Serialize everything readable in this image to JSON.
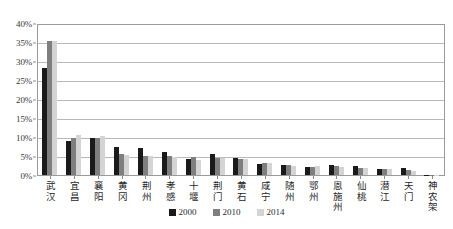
{
  "chart_data": {
    "type": "bar",
    "title": "",
    "subtitle": "",
    "xlabel": "",
    "ylabel": "",
    "ylim": [
      0,
      40
    ],
    "ytick_values": [
      0,
      5,
      10,
      15,
      20,
      25,
      30,
      35,
      40
    ],
    "ytick_labels": [
      "0%",
      "5%",
      "10%",
      "15%",
      "20%",
      "25%",
      "30%",
      "35%",
      "40%"
    ],
    "grid": true,
    "legend_position": "bottom",
    "value_unit": "%",
    "categories": [
      "武汉",
      "宜昌",
      "襄阳",
      "黄冈",
      "荆州",
      "孝感",
      "十堰",
      "荆门",
      "黄石",
      "咸宁",
      "随州",
      "鄂州",
      "恩施州",
      "仙桃",
      "潜江",
      "天门",
      "神农架"
    ],
    "series": [
      {
        "name": "2000",
        "color": "#1a1a1a",
        "values": [
          28.2,
          8.9,
          9.7,
          7.4,
          7.0,
          6.0,
          4.1,
          5.6,
          4.6,
          3.0,
          2.7,
          2.0,
          2.7,
          2.5,
          1.7,
          1.8,
          0.1
        ]
      },
      {
        "name": "2010",
        "color": "#7f7f7f",
        "values": [
          35.2,
          9.8,
          9.8,
          5.4,
          5.1,
          4.9,
          4.7,
          4.5,
          4.3,
          3.2,
          2.6,
          2.2,
          2.3,
          1.9,
          1.7,
          1.3,
          0.1
        ]
      },
      {
        "name": "2014",
        "color": "#d4d4d4",
        "values": [
          35.2,
          10.4,
          10.3,
          5.3,
          5.0,
          4.8,
          4.0,
          4.4,
          4.1,
          3.2,
          2.5,
          2.3,
          2.0,
          1.8,
          1.6,
          1.1,
          0.1
        ]
      }
    ]
  }
}
